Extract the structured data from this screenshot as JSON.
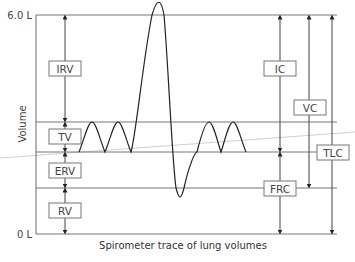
{
  "diagram": {
    "title": "Spirometer trace of lung volumes",
    "y_axis_label": "Volume",
    "y_top_label": "6.0 L",
    "y_bottom_label": "0 L",
    "left_labels": {
      "irv": "IRV",
      "tv": "TV",
      "erv": "ERV",
      "rv": "RV"
    },
    "right_labels": {
      "ic": "IC",
      "vc": "VC",
      "tlc": "TLC",
      "frc": "FRC"
    },
    "colors": {
      "line": "#555555",
      "trace": "#222222",
      "guide": "#bbbbbb"
    }
  }
}
